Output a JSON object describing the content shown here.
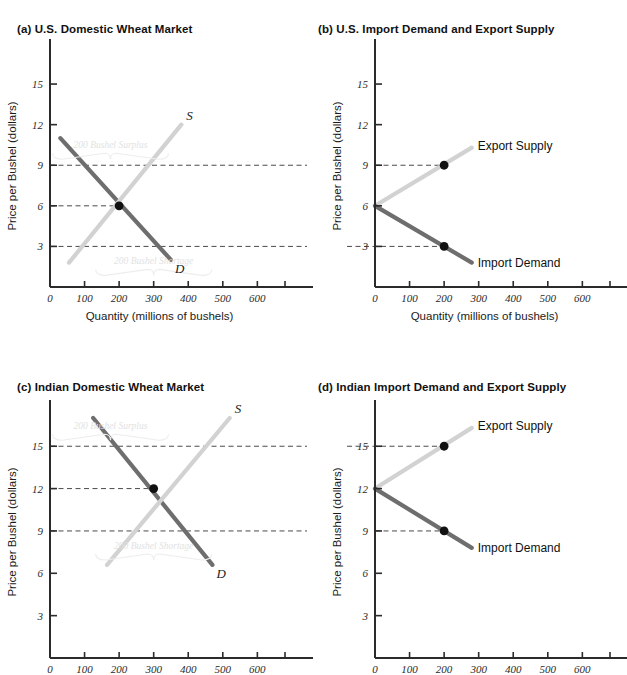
{
  "figure": {
    "axis_labels": {
      "x": "Quantity (millions of bushels)",
      "y": "Price per Bushel (dollars)"
    },
    "x_ticks": [
      "0",
      "100",
      "200",
      "300",
      "400",
      "500",
      "600"
    ],
    "x_tick_values": [
      0,
      100,
      200,
      300,
      400,
      500,
      600
    ],
    "y_ticks": [
      "3",
      "6",
      "9",
      "12",
      "15"
    ],
    "y_tick_values": [
      3,
      6,
      9,
      12,
      15
    ],
    "colors": {
      "demand_line": "#6e6e6e",
      "supply_line": "#d2d2d2",
      "axis": "#2b2b2b",
      "dash": "#4a4a4a",
      "dot": "#111111",
      "watermark": "#e2e2e2"
    }
  },
  "panels": [
    {
      "key": "a",
      "title": "(a) U.S. Domestic Wheat Market",
      "curve_labels": {
        "supply": "S",
        "demand": "D"
      },
      "annotations": [
        {
          "text": "200 Bushel Surplus",
          "at_price": 9
        },
        {
          "text": "200 Bushel Shortage",
          "at_price": 3
        }
      ],
      "dashed_prices": [
        9,
        6,
        3
      ],
      "equilibrium": {
        "quantity": 200,
        "price": 6
      }
    },
    {
      "key": "b",
      "title": "(b) U.S. Import Demand and Export Supply",
      "series_labels": {
        "export": "Export Supply",
        "import": "Import Demand"
      },
      "autarky_price": 6,
      "points": [
        {
          "label": "Export Supply",
          "quantity": 200,
          "price": 9
        },
        {
          "label": "Import Demand",
          "quantity": 200,
          "price": 3
        }
      ],
      "dashed_prices": [
        9,
        3
      ]
    },
    {
      "key": "c",
      "title": "(c) Indian Domestic Wheat Market",
      "curve_labels": {
        "supply": "S",
        "demand": "D"
      },
      "annotations": [
        {
          "text": "200 Bushel Surplus",
          "at_price": 15
        },
        {
          "text": "200 Bushel Shortage",
          "at_price": 9
        }
      ],
      "dashed_prices": [
        15,
        12,
        9
      ],
      "equilibrium": {
        "quantity": 300,
        "price": 12
      }
    },
    {
      "key": "d",
      "title": "(d) Indian Import Demand and Export Supply",
      "series_labels": {
        "export": "Export Supply",
        "import": "Import Demand"
      },
      "autarky_price": 12,
      "points": [
        {
          "label": "Export Supply",
          "quantity": 200,
          "price": 15
        },
        {
          "label": "Import Demand",
          "quantity": 200,
          "price": 9
        }
      ],
      "dashed_prices": [
        15,
        9
      ]
    }
  ],
  "chart_data": [
    {
      "type": "line",
      "panel": "a",
      "title": "(a) U.S. Domestic Wheat Market",
      "xlabel": "Quantity (millions of bushels)",
      "ylabel": "Price per Bushel (dollars)",
      "xlim": [
        0,
        680
      ],
      "ylim": [
        0,
        17
      ],
      "xticks": [
        0,
        100,
        200,
        300,
        400,
        500,
        600
      ],
      "yticks": [
        3,
        6,
        9,
        12,
        15
      ],
      "grid": false,
      "legend": "none",
      "series": [
        {
          "name": "Demand (D)",
          "points": [
            [
              30,
              11
            ],
            [
              350,
              2
            ]
          ]
        },
        {
          "name": "Supply (S)",
          "points": [
            [
              55,
              1.8
            ],
            [
              380,
              12
            ]
          ]
        }
      ],
      "markers": [
        {
          "label": "equilibrium",
          "x": 200,
          "y": 6
        }
      ],
      "reference_lines_y": [
        9,
        6,
        3
      ],
      "annotations": [
        {
          "text": "200 Bushel Surplus",
          "y": 9
        },
        {
          "text": "200 Bushel Shortage",
          "y": 3
        }
      ]
    },
    {
      "type": "line",
      "panel": "b",
      "title": "(b) U.S. Import Demand and Export Supply",
      "xlabel": "Quantity (millions of bushels)",
      "ylabel": "Price per Bushel (dollars)",
      "xlim": [
        0,
        680
      ],
      "ylim": [
        0,
        17
      ],
      "xticks": [
        0,
        100,
        200,
        300,
        400,
        500,
        600
      ],
      "yticks": [
        3,
        6,
        9,
        12,
        15
      ],
      "grid": false,
      "legend": "inline labels",
      "series": [
        {
          "name": "Export Supply",
          "points": [
            [
              0,
              6
            ],
            [
              280,
              10.3
            ]
          ]
        },
        {
          "name": "Import Demand",
          "points": [
            [
              0,
              6
            ],
            [
              280,
              1.8
            ]
          ]
        }
      ],
      "markers": [
        {
          "label": "Export Supply point",
          "x": 200,
          "y": 9
        },
        {
          "label": "Import Demand point",
          "x": 200,
          "y": 3
        }
      ],
      "reference_lines_y": [
        9,
        3
      ]
    },
    {
      "type": "line",
      "panel": "c",
      "title": "(c) Indian Domestic Wheat Market",
      "xlabel": "Quantity (millions of bushels)",
      "ylabel": "Price per Bushel (dollars)",
      "xlim": [
        0,
        680
      ],
      "ylim": [
        0,
        17
      ],
      "xticks": [
        0,
        100,
        200,
        300,
        400,
        500,
        600
      ],
      "yticks": [
        3,
        6,
        9,
        12,
        15
      ],
      "grid": false,
      "legend": "none",
      "series": [
        {
          "name": "Demand (D)",
          "points": [
            [
              125,
              17
            ],
            [
              470,
              6.6
            ]
          ]
        },
        {
          "name": "Supply (S)",
          "points": [
            [
              165,
              6.6
            ],
            [
              520,
              17
            ]
          ]
        }
      ],
      "markers": [
        {
          "label": "equilibrium",
          "x": 300,
          "y": 12
        }
      ],
      "reference_lines_y": [
        15,
        12,
        9
      ],
      "annotations": [
        {
          "text": "200 Bushel Surplus",
          "y": 15
        },
        {
          "text": "200 Bushel Shortage",
          "y": 9
        }
      ]
    },
    {
      "type": "line",
      "panel": "d",
      "title": "(d) Indian Import Demand and Export Supply",
      "xlabel": "Quantity (millions of bushels)",
      "ylabel": "Price per Bushel (dollars)",
      "xlim": [
        0,
        680
      ],
      "ylim": [
        0,
        17
      ],
      "xticks": [
        0,
        100,
        200,
        300,
        400,
        500,
        600
      ],
      "yticks": [
        3,
        6,
        9,
        12,
        15
      ],
      "grid": false,
      "legend": "inline labels",
      "series": [
        {
          "name": "Export Supply",
          "points": [
            [
              0,
              12
            ],
            [
              280,
              16.3
            ]
          ]
        },
        {
          "name": "Import Demand",
          "points": [
            [
              0,
              12
            ],
            [
              280,
              7.8
            ]
          ]
        }
      ],
      "markers": [
        {
          "label": "Export Supply point",
          "x": 200,
          "y": 15
        },
        {
          "label": "Import Demand point",
          "x": 200,
          "y": 9
        }
      ],
      "reference_lines_y": [
        15,
        9
      ]
    }
  ]
}
